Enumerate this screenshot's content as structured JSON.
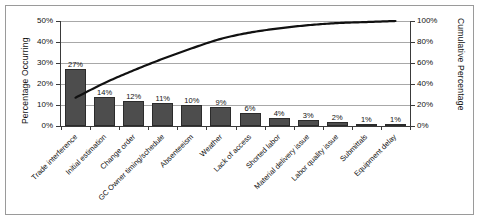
{
  "chart_data": {
    "type": "bar",
    "title": "",
    "xlabel": "",
    "ylabel": "Percentage Occurring",
    "y2label": "Cumulative Percentage",
    "ylim": [
      0,
      50
    ],
    "y2lim": [
      0,
      100
    ],
    "grid": true,
    "legend": "none",
    "categories": [
      "Trade interference",
      "Initial estimation",
      "Change order",
      "GC Owner timing/schedule",
      "Absenteeism",
      "Weather",
      "Lack of access",
      "Shorted labor",
      "Material delivery issue",
      "Labor quality issue",
      "Submittals",
      "Equipment delay"
    ],
    "values": [
      27,
      14,
      12,
      11,
      10,
      9,
      6,
      4,
      3,
      2,
      1,
      1
    ],
    "value_labels": [
      "27%",
      "14%",
      "12%",
      "11%",
      "10%",
      "9%",
      "6%",
      "4%",
      "3%",
      "2%",
      "1%",
      "1%"
    ],
    "series": [
      {
        "name": "Percentage Occurring",
        "type": "bar",
        "axis": "left",
        "values": [
          27,
          14,
          12,
          11,
          10,
          9,
          6,
          4,
          3,
          2,
          1,
          1
        ]
      },
      {
        "name": "Cumulative Percentage",
        "type": "line",
        "axis": "right",
        "values": [
          27,
          41,
          53,
          64,
          74,
          83,
          89,
          93,
          96,
          98,
          99,
          100
        ]
      }
    ],
    "yticks": [
      0,
      10,
      20,
      30,
      40,
      50
    ],
    "ytick_labels": [
      "0%",
      "10%",
      "20%",
      "30%",
      "40%",
      "50%"
    ],
    "y2ticks": [
      0,
      20,
      40,
      60,
      80,
      100
    ],
    "y2tick_labels": [
      "0%",
      "20%",
      "40%",
      "60%",
      "80%",
      "100%"
    ],
    "colors": {
      "bar_fill": "#4d4d4d",
      "bar_border": "#2b2b2b",
      "line": "#111111",
      "grid": "#a8a8a8",
      "axis": "#3a3a3a",
      "frame": "#9a9a9a",
      "background": "#ffffff"
    }
  }
}
